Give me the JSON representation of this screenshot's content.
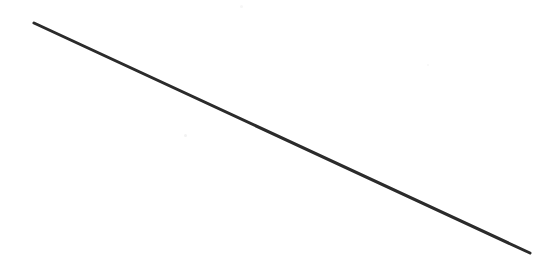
{
  "figure": {
    "description": "A single straight dark line drawn on a plain white background, sloping downward from upper left to lower right.",
    "canvas": {
      "width": 560,
      "height": 265,
      "background_color": "#ffffff"
    },
    "line": {
      "label": "diagonal-line",
      "stroke_color": "#2b2b2b",
      "stroke_width": 3,
      "start_x": 34,
      "start_y": 23,
      "end_x": 530,
      "end_y": 253,
      "linecap": "round",
      "slope": 0.464,
      "angle_degrees": -24.9,
      "length_px": 546
    },
    "artifacts": [
      {
        "label": "scan-speck-center",
        "x": 184,
        "y": 134,
        "size": 3,
        "color": "#f2f2f2"
      },
      {
        "label": "scan-speck-top",
        "x": 240,
        "y": 5,
        "size": 3,
        "color": "#f6f6f6"
      },
      {
        "label": "scan-speck-right",
        "x": 427,
        "y": 64,
        "size": 2,
        "color": "#f7f7f7"
      }
    ]
  }
}
